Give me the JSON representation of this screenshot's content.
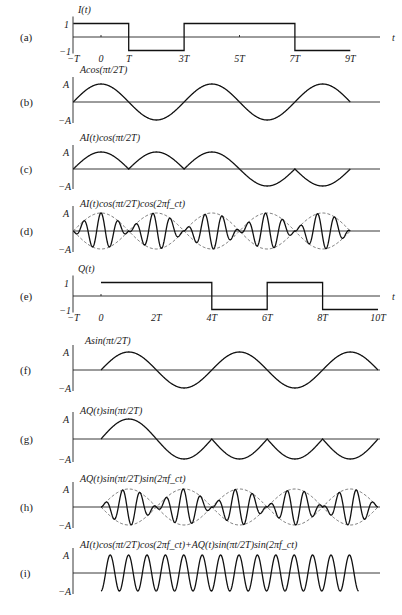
{
  "figure": {
    "caption": "",
    "time_unit": "T",
    "panels": [
      {
        "tag": "(a)",
        "title": "I(t)",
        "type": "binary",
        "ylabels": [
          "1",
          "−1"
        ],
        "tick_labels": [
          "−T",
          "0",
          "T",
          "3T",
          "5T",
          "7T",
          "9T"
        ],
        "axis_label": "t"
      },
      {
        "tag": "(b)",
        "title": "Acos(πt/2T)",
        "type": "analog",
        "ylabels": [
          "A",
          "−A"
        ]
      },
      {
        "tag": "(c)",
        "title": "AI(t)cos(πt/2T)",
        "type": "analog",
        "ylabels": [
          "A",
          "−A"
        ]
      },
      {
        "tag": "(d)",
        "title": "AI(t)cos(πt/2T)cos(2πf_ct)",
        "type": "modulated",
        "ylabels": [
          "A",
          "−A"
        ]
      },
      {
        "tag": "(e)",
        "title": "Q(t)",
        "type": "binary",
        "ylabels": [
          "1",
          "−1"
        ],
        "tick_labels": [
          "−T",
          "0",
          "2T",
          "4T",
          "6T",
          "8T",
          "10T"
        ],
        "axis_label": "t"
      },
      {
        "tag": "(f)",
        "title": "Asin(πt/2T)",
        "type": "analog",
        "ylabels": [
          "A",
          "−A"
        ]
      },
      {
        "tag": "(g)",
        "title": "AQ(t)sin(πt/2T)",
        "type": "analog",
        "ylabels": [
          "A",
          "−A"
        ]
      },
      {
        "tag": "(h)",
        "title": "AQ(t)sin(πt/2T)sin(2πf_ct)",
        "type": "modulated",
        "ylabels": [
          "A",
          "−A"
        ]
      },
      {
        "tag": "(i)",
        "title": "AI(t)cos(πt/2T)cos(2πf_ct)+AQ(t)sin(πt/2T)sin(2πf_ct)",
        "type": "msk",
        "ylabels": [
          "A",
          "−A"
        ]
      }
    ]
  },
  "chart_data": {
    "type": "line",
    "xlabel": "t",
    "x_units": "T",
    "x_range": [
      -1,
      10
    ],
    "I_bits": {
      "intervals": [
        [
          -1,
          1,
          1
        ],
        [
          1,
          3,
          -1
        ],
        [
          3,
          7,
          1
        ],
        [
          7,
          9,
          -1
        ]
      ]
    },
    "Q_bits": {
      "intervals": [
        [
          0,
          4,
          1
        ],
        [
          4,
          6,
          -1
        ],
        [
          6,
          8,
          1
        ],
        [
          8,
          10,
          -1
        ]
      ]
    },
    "series": [
      {
        "name": "I(t)",
        "panel": "a",
        "range": [
          -1,
          9
        ]
      },
      {
        "name": "Acos(πt/2T)",
        "panel": "b",
        "range": [
          -1,
          9
        ]
      },
      {
        "name": "AI(t)cos(πt/2T)",
        "panel": "c",
        "range": [
          -1,
          9
        ]
      },
      {
        "name": "AI(t)cos(πt/2T)cos(2πf_ct)",
        "panel": "d",
        "range": [
          -1,
          9
        ],
        "envelope": "dashed"
      },
      {
        "name": "Q(t)",
        "panel": "e",
        "range": [
          0,
          10
        ]
      },
      {
        "name": "Asin(πt/2T)",
        "panel": "f",
        "range": [
          0,
          10
        ]
      },
      {
        "name": "AQ(t)sin(πt/2T)",
        "panel": "g",
        "range": [
          0,
          10
        ]
      },
      {
        "name": "AQ(t)sin(πt/2T)sin(2πf_ct)",
        "panel": "h",
        "range": [
          0,
          10
        ],
        "envelope": "dashed"
      },
      {
        "name": "MSK sum",
        "panel": "i",
        "range": [
          0,
          9.3
        ],
        "cycles": 14
      }
    ],
    "carrier_cycles_per_T": 1.6,
    "amplitude": "A"
  }
}
